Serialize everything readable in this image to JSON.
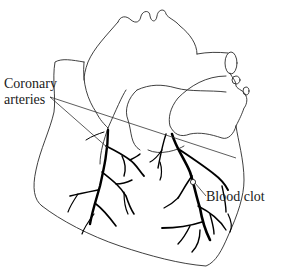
{
  "figure": {
    "labels": {
      "coronary_line1": "Coronary",
      "coronary_line2": "arteries",
      "blood_clot": "Blood clot"
    },
    "colors": {
      "background": "#ffffff",
      "outline": "#2a2a2a",
      "arteries": "#000000",
      "text": "#1a1a1a"
    }
  }
}
